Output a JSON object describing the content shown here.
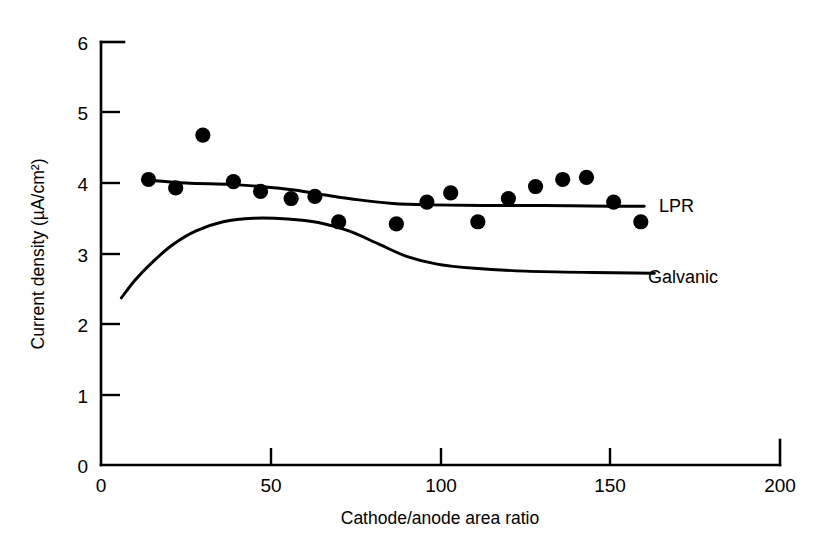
{
  "chart_data": {
    "type": "scatter",
    "title": "",
    "xlabel": "Cathode/anode area ratio",
    "ylabel": "Current density (µA/cm²)",
    "xlim": [
      0,
      200
    ],
    "ylim": [
      0,
      6
    ],
    "xticks": [
      0,
      50,
      100,
      150,
      200
    ],
    "yticks": [
      0,
      1,
      2,
      3,
      4,
      5,
      6
    ],
    "xtick_labels": [
      "0",
      "50",
      "100",
      "150",
      "200"
    ],
    "ytick_labels": [
      "0",
      "1",
      "2",
      "3",
      "4",
      "5",
      "6"
    ],
    "grid": false,
    "legend_position": "inline-right-of-curve",
    "marker": "filled-circle",
    "marker_color": "#000000",
    "line_color": "#000000",
    "series": [
      {
        "name": "LPR",
        "label": "LPR",
        "kind": "scatter+fit-line",
        "points": [
          {
            "x": 14,
            "y": 4.05
          },
          {
            "x": 22,
            "y": 3.93
          },
          {
            "x": 30,
            "y": 4.68
          },
          {
            "x": 39,
            "y": 4.02
          },
          {
            "x": 47,
            "y": 3.88
          },
          {
            "x": 56,
            "y": 3.78
          },
          {
            "x": 63,
            "y": 3.81
          },
          {
            "x": 70,
            "y": 3.45
          },
          {
            "x": 87,
            "y": 3.42
          },
          {
            "x": 96,
            "y": 3.73
          },
          {
            "x": 103,
            "y": 3.86
          },
          {
            "x": 111,
            "y": 3.45
          },
          {
            "x": 120,
            "y": 3.78
          },
          {
            "x": 128,
            "y": 3.95
          },
          {
            "x": 136,
            "y": 4.05
          },
          {
            "x": 143,
            "y": 4.08
          },
          {
            "x": 151,
            "y": 3.73
          },
          {
            "x": 159,
            "y": 3.45
          }
        ],
        "fit_line": [
          {
            "x": 14,
            "y": 4.04
          },
          {
            "x": 25,
            "y": 4.0
          },
          {
            "x": 38,
            "y": 3.98
          },
          {
            "x": 47,
            "y": 3.95
          },
          {
            "x": 57,
            "y": 3.9
          },
          {
            "x": 66,
            "y": 3.83
          },
          {
            "x": 76,
            "y": 3.76
          },
          {
            "x": 86,
            "y": 3.71
          },
          {
            "x": 97,
            "y": 3.69
          },
          {
            "x": 112,
            "y": 3.68
          },
          {
            "x": 130,
            "y": 3.68
          },
          {
            "x": 150,
            "y": 3.67
          },
          {
            "x": 160,
            "y": 3.67
          }
        ]
      },
      {
        "name": "Galvanic",
        "label": "Galvanic",
        "kind": "line",
        "line": [
          {
            "x": 6,
            "y": 2.37
          },
          {
            "x": 10,
            "y": 2.62
          },
          {
            "x": 15,
            "y": 2.87
          },
          {
            "x": 21,
            "y": 3.12
          },
          {
            "x": 28,
            "y": 3.32
          },
          {
            "x": 36,
            "y": 3.45
          },
          {
            "x": 45,
            "y": 3.5
          },
          {
            "x": 55,
            "y": 3.49
          },
          {
            "x": 64,
            "y": 3.44
          },
          {
            "x": 73,
            "y": 3.32
          },
          {
            "x": 82,
            "y": 3.13
          },
          {
            "x": 90,
            "y": 2.96
          },
          {
            "x": 99,
            "y": 2.85
          },
          {
            "x": 110,
            "y": 2.79
          },
          {
            "x": 125,
            "y": 2.75
          },
          {
            "x": 145,
            "y": 2.73
          },
          {
            "x": 163,
            "y": 2.72
          }
        ]
      }
    ]
  },
  "labels": {
    "lpr": "LPR",
    "galvanic": "Galvanic",
    "x_axis_title": "Cathode/anode area ratio",
    "y_axis_title": "Current density (µA/cm²)"
  },
  "colors": {
    "ink": "#000000",
    "background": "#ffffff"
  }
}
